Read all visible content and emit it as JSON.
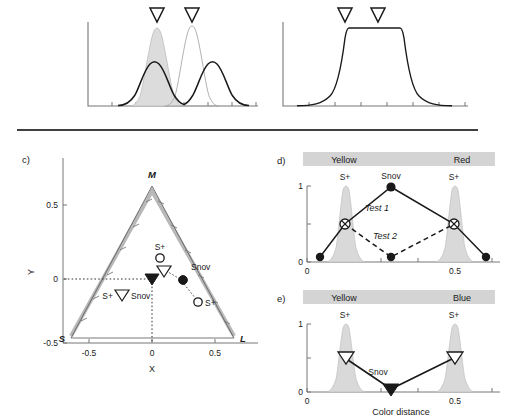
{
  "figure": {
    "panels": [
      {
        "id": "a-top-left",
        "letter": ""
      },
      {
        "id": "b-top-right",
        "letter": ""
      },
      {
        "id": "c",
        "letter": "c)"
      },
      {
        "id": "d",
        "letter": "d)"
      },
      {
        "id": "e",
        "letter": "e)"
      }
    ]
  },
  "panel_c": {
    "letter": "c)",
    "xlabel": "X",
    "ylabel": "Y",
    "x_ticks": [
      "-0.5",
      "0",
      "0.5"
    ],
    "y_ticks": [
      "0.5",
      "0",
      "-0.5"
    ],
    "vertices": {
      "left": "S",
      "top": "M",
      "right": "L"
    },
    "markers": [
      {
        "name": "S+",
        "type": "open-circle",
        "label": "S+"
      },
      {
        "name": "Snov-open-triangle",
        "type": "open-down-triangle",
        "label": ""
      },
      {
        "name": "Snov-filled-circle",
        "type": "filled-circle",
        "label": "Snov"
      },
      {
        "name": "S+ lower",
        "type": "open-circle",
        "label": "S+"
      },
      {
        "name": "S+ triangle pair",
        "type": "open-down-triangle",
        "label": "S+"
      },
      {
        "name": "Snov-filled-triangle",
        "type": "filled-down-triangle",
        "label": "Snov"
      }
    ],
    "labels": {
      "s_plus_upper": "S+",
      "snov_right": "Snov",
      "s_plus_left": "S+",
      "snov_left": "Snov",
      "s_plus_lower": "S+"
    }
  },
  "panel_d": {
    "letter": "d)",
    "band_left_label": "Yellow",
    "band_right_label": "Red",
    "y_ticks": [
      "1",
      "0"
    ],
    "x_ticks": [
      "0",
      "0.5"
    ],
    "point_labels": {
      "left_s": "S+",
      "center": "Snov",
      "right_s": "S+"
    },
    "series_labels": {
      "test1": "Test 1",
      "test2": "Test 2"
    }
  },
  "panel_e": {
    "letter": "e)",
    "band_left_label": "Yellow",
    "band_right_label": "Blue",
    "y_ticks": [
      "1",
      "0"
    ],
    "x_ticks": [
      "0",
      "0.5"
    ],
    "xlabel": "Color distance",
    "point_labels": {
      "left_s": "S+",
      "right_s": "S+",
      "center": "Snov"
    }
  },
  "colors": {
    "band_fill": "#d4d4d4",
    "curve_fill": "#d9d9d9",
    "axis": "#7a7a7a",
    "dark": "#1a1a1a",
    "triangle_edge": "#b0b0b0"
  }
}
